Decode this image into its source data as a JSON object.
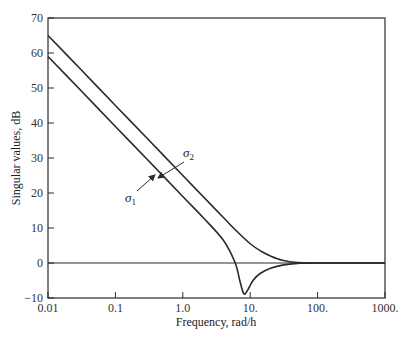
{
  "chart_data": {
    "type": "line",
    "title": "",
    "xlabel": "Frequency, rad/h",
    "ylabel": "Singular values, dB",
    "xscale": "log",
    "xlim": [
      0.01,
      1000
    ],
    "ylim": [
      -10,
      70
    ],
    "grid": false,
    "x_ticks": [
      0.01,
      0.1,
      1.0,
      10,
      100,
      1000
    ],
    "x_tick_labels": [
      "0.01",
      "0.1",
      "1.0",
      "10.",
      "100.",
      "1000."
    ],
    "y_ticks": [
      -10,
      0,
      10,
      20,
      30,
      40,
      50,
      60,
      70
    ],
    "y_tick_labels": [
      "-10",
      "0",
      "10",
      "20",
      "30",
      "40",
      "50",
      "60",
      "70"
    ],
    "series": [
      {
        "name": "σ2",
        "label_main": "σ",
        "label_sub": "2",
        "x": [
          0.01,
          0.03,
          0.1,
          0.3,
          1.0,
          2.0,
          4.0,
          6.0,
          10.0,
          15.0,
          20.0,
          30.0,
          50.0,
          100.0,
          1000.0
        ],
        "y": [
          65,
          55.5,
          45,
          35.5,
          25,
          19,
          13,
          9.5,
          5.5,
          3.2,
          2,
          0.8,
          0.1,
          0,
          0
        ]
      },
      {
        "name": "σ1",
        "label_main": "σ",
        "label_sub": "1",
        "x": [
          0.01,
          0.03,
          0.1,
          0.3,
          1.0,
          2.0,
          4.0,
          6.0,
          7.0,
          8.0,
          9.0,
          11.0,
          14.0,
          20.0,
          30.0,
          50.0,
          100.0,
          1000.0
        ],
        "y": [
          59,
          49.5,
          39,
          29.5,
          19,
          13,
          6.5,
          0,
          -5,
          -8.7,
          -8,
          -5,
          -3,
          -1.5,
          -0.6,
          -0.1,
          0,
          0
        ]
      }
    ],
    "reference_line": {
      "y": 0
    },
    "annotations": [
      {
        "text": "σ2",
        "arrow_to": [
          0.45,
          32
        ]
      },
      {
        "text": "σ1",
        "arrow_to": [
          0.45,
          26
        ]
      }
    ]
  }
}
